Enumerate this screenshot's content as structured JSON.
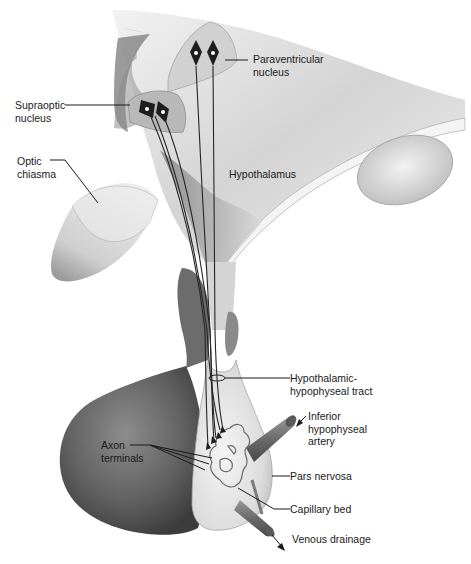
{
  "diagram": {
    "type": "anatomical-illustration",
    "palette": {
      "background": "#ffffff",
      "tissue_light": "#e6e6e6",
      "tissue_mid": "#bdbdbd",
      "tissue_dark": "#6e6e6e",
      "anterior_lobe": "#5f5f5f",
      "outline": "#8a8a8a",
      "neuron": "#1e1e1e",
      "text": "#1a1a1a"
    },
    "labels": {
      "paraventricular": {
        "line1": "Paraventricular",
        "line2": "nucleus"
      },
      "supraoptic": {
        "line1": "Supraoptic",
        "line2": "nucleus"
      },
      "optic_chiasma": {
        "line1": "Optic",
        "line2": "chiasma"
      },
      "hypothalamus": {
        "line1": "Hypothalamus"
      },
      "tract": {
        "line1": "Hypothalamic-",
        "line2": "hypophyseal tract"
      },
      "inferior_artery": {
        "line1": "Inferior",
        "line2": "hypophyseal",
        "line3": "artery"
      },
      "axon_terminals": {
        "line1": "Axon",
        "line2": "terminals"
      },
      "pars_nervosa": {
        "line1": "Pars nervosa"
      },
      "capillary_bed": {
        "line1": "Capillary bed"
      },
      "venous_drainage": {
        "line1": "Venous drainage"
      }
    }
  }
}
